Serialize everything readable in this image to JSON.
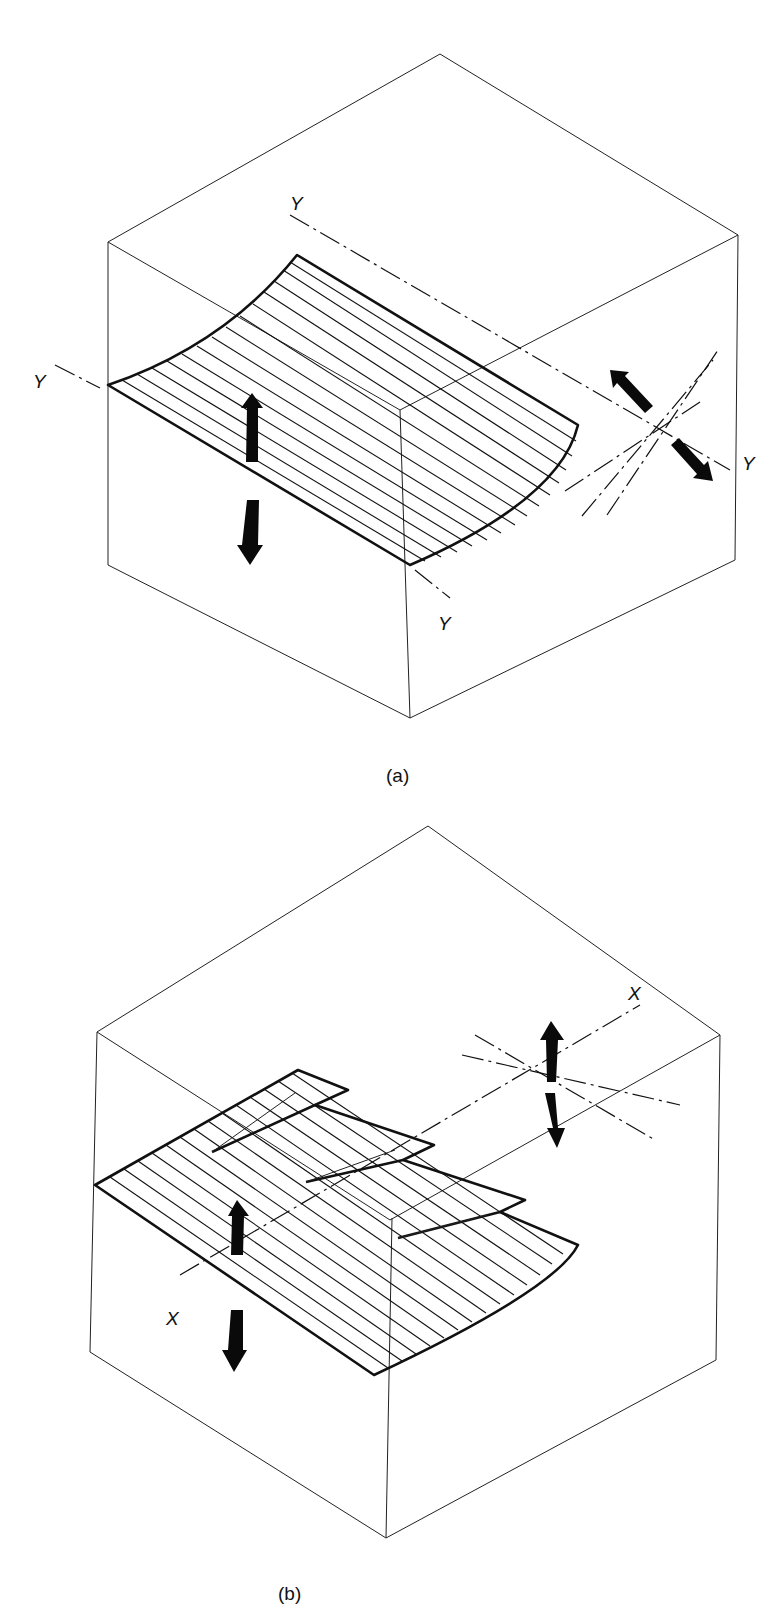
{
  "figure": {
    "panels": [
      {
        "id": "a",
        "caption": "(a)",
        "description": "Cube with a curved (concave) ruled surface sheet; Y–Y axes; paired black double arrows indicating motion",
        "axis_labels": [
          "Y",
          "Y",
          "Y",
          "Y"
        ]
      },
      {
        "id": "b",
        "caption": "(b)",
        "description": "Cube with stacked stepped ruled sheets; X–X axis; paired black double arrows indicating motion",
        "axis_labels": [
          "X",
          "X"
        ]
      }
    ],
    "colors": {
      "line": "#111111",
      "background": "#ffffff"
    }
  }
}
